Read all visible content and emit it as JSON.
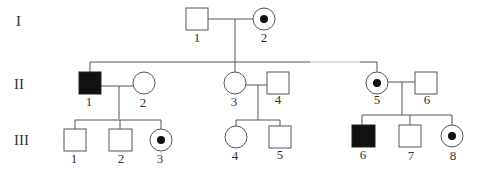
{
  "generations": [
    {
      "id": "I",
      "label": "I"
    },
    {
      "id": "II",
      "label": "II"
    },
    {
      "id": "III",
      "label": "III"
    }
  ],
  "individuals": {
    "I-1": {
      "label": "1",
      "sex": "male",
      "status": "unaffected"
    },
    "I-2": {
      "label": "2",
      "sex": "female",
      "status": "carrier"
    },
    "II-1": {
      "label": "1",
      "sex": "male",
      "status": "affected"
    },
    "II-2": {
      "label": "2",
      "sex": "female",
      "status": "unaffected"
    },
    "II-3": {
      "label": "3",
      "sex": "female",
      "status": "unaffected"
    },
    "II-4": {
      "label": "4",
      "sex": "male",
      "status": "unaffected"
    },
    "II-5": {
      "label": "5",
      "sex": "female",
      "status": "carrier"
    },
    "II-6": {
      "label": "6",
      "sex": "male",
      "status": "unaffected"
    },
    "III-1": {
      "label": "1",
      "sex": "male",
      "status": "unaffected"
    },
    "III-2": {
      "label": "2",
      "sex": "male",
      "status": "unaffected"
    },
    "III-3": {
      "label": "3",
      "sex": "female",
      "status": "carrier"
    },
    "III-4": {
      "label": "4",
      "sex": "female",
      "status": "unaffected"
    },
    "III-5": {
      "label": "5",
      "sex": "male",
      "status": "unaffected"
    },
    "III-6": {
      "label": "6",
      "sex": "male",
      "status": "affected"
    },
    "III-7": {
      "label": "7",
      "sex": "male",
      "status": "unaffected"
    },
    "III-8": {
      "label": "8",
      "sex": "female",
      "status": "carrier"
    }
  },
  "matings": [
    {
      "partners": [
        "I-1",
        "I-2"
      ],
      "children": [
        "II-1",
        "II-3",
        "II-5"
      ]
    },
    {
      "partners": [
        "II-1",
        "II-2"
      ],
      "children": [
        "III-1",
        "III-2",
        "III-3"
      ]
    },
    {
      "partners": [
        "II-3",
        "II-4"
      ],
      "children": [
        "III-4",
        "III-5"
      ]
    },
    {
      "partners": [
        "II-5",
        "II-6"
      ],
      "children": [
        "III-6",
        "III-7",
        "III-8"
      ]
    }
  ],
  "legend_semantics": {
    "filled_square": "affected male",
    "circle_with_dot": "carrier female",
    "open_square": "unaffected male",
    "open_circle": "unaffected female"
  }
}
